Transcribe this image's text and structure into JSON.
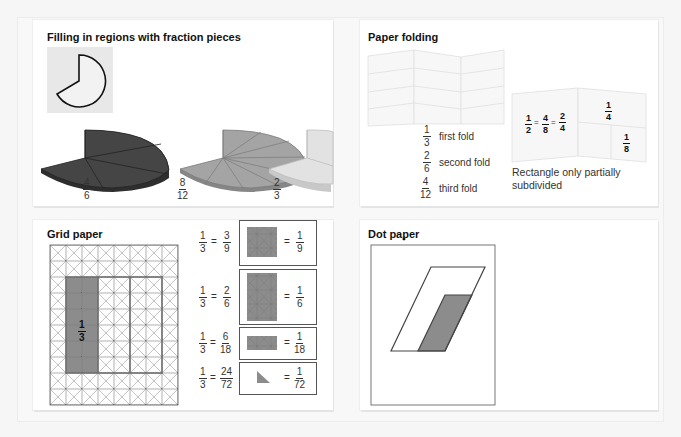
{
  "colors": {
    "dark_piece": "#3a3a3a",
    "mid_piece": "#9a9a9a",
    "light_piece": "#dedede",
    "shade": "#8a8a8a",
    "panel_bg": "#ffffff",
    "page_bg": "#f6f6f6"
  },
  "panels": {
    "fraction_pieces": {
      "title": "Filling in regions with fraction pieces",
      "pieces": [
        {
          "numerator": "4",
          "denominator": "6",
          "shade": "dark"
        },
        {
          "numerator": "8",
          "denominator": "12",
          "shade": "medium"
        },
        {
          "numerator": "2",
          "denominator": "3",
          "shade": "light"
        }
      ]
    },
    "paper_folding": {
      "title": "Paper folding",
      "folds": [
        {
          "numerator": "1",
          "denominator": "3",
          "label": "first fold"
        },
        {
          "numerator": "2",
          "denominator": "6",
          "label": "second fold"
        },
        {
          "numerator": "4",
          "denominator": "12",
          "label": "third fold"
        }
      ],
      "partial": {
        "equation": [
          {
            "numerator": "1",
            "denominator": "2"
          },
          {
            "numerator": "4",
            "denominator": "8"
          },
          {
            "numerator": "2",
            "denominator": "4"
          }
        ],
        "quarter": {
          "numerator": "1",
          "denominator": "4"
        },
        "eighth": {
          "numerator": "1",
          "denominator": "8"
        },
        "caption_line1": "Rectangle only partially",
        "caption_line2": "subdivided"
      }
    },
    "grid_paper": {
      "title": "Grid paper",
      "region_fraction": {
        "numerator": "1",
        "denominator": "3"
      },
      "equivalences": [
        {
          "left": {
            "numerator": "1",
            "denominator": "3"
          },
          "equiv": {
            "numerator": "3",
            "denominator": "9"
          },
          "unit": {
            "numerator": "1",
            "denominator": "9"
          }
        },
        {
          "left": {
            "numerator": "1",
            "denominator": "3"
          },
          "equiv": {
            "numerator": "2",
            "denominator": "6"
          },
          "unit": {
            "numerator": "1",
            "denominator": "6"
          }
        },
        {
          "left": {
            "numerator": "1",
            "denominator": "3"
          },
          "equiv": {
            "numerator": "6",
            "denominator": "18"
          },
          "unit": {
            "numerator": "1",
            "denominator": "18"
          }
        },
        {
          "left": {
            "numerator": "1",
            "denominator": "3"
          },
          "equiv": {
            "numerator": "24",
            "denominator": "72"
          },
          "unit": {
            "numerator": "1",
            "denominator": "72"
          }
        }
      ],
      "equals": "="
    },
    "dot_paper": {
      "title": "Dot paper",
      "third": {
        "numerator": "1",
        "denominator": "3"
      },
      "sixth": {
        "left": {
          "numerator": "2",
          "denominator": "6"
        },
        "unit": {
          "numerator": "1",
          "denominator": "6"
        }
      },
      "twelfth": {
        "left": {
          "numerator": "4",
          "denominator": "12"
        },
        "or_label": "or",
        "unit": {
          "numerator": "1",
          "denominator": "12"
        }
      },
      "equals": "="
    }
  }
}
